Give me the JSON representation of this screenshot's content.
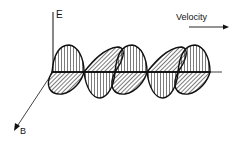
{
  "diagram": {
    "labels": {
      "e_axis": "E",
      "b_axis": "B",
      "velocity": "Velocity"
    },
    "colors": {
      "stroke": "#111111",
      "background": "#ffffff"
    },
    "waves": [
      {
        "name": "electric-field",
        "hatch": "vertical",
        "plane": "vertical"
      },
      {
        "name": "magnetic-field",
        "hatch": "diagonal",
        "plane": "horizontal-perspective"
      }
    ]
  }
}
